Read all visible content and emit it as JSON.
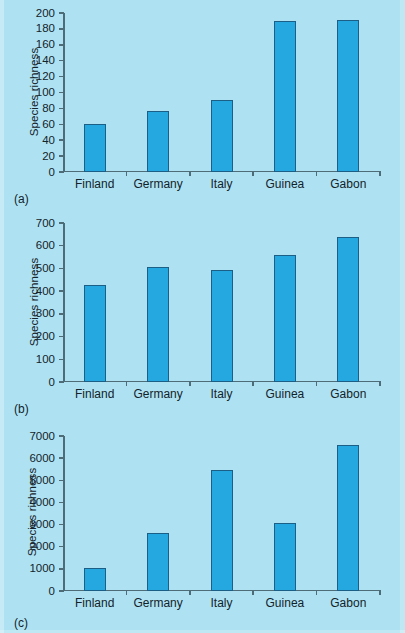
{
  "figure": {
    "background_color": "#aee2f3",
    "bar_fill_color": "#25a8e0",
    "bar_edge_color": "#1c5f86",
    "axis_color": "#4e6b78",
    "text_color": "#142229"
  },
  "panels": [
    {
      "tag": "(a)",
      "ylabel": "Species richness"
    },
    {
      "tag": "(b)",
      "ylabel": "Species richness"
    },
    {
      "tag": "(c)",
      "ylabel": "Species richness"
    }
  ],
  "chart_data": [
    {
      "type": "bar",
      "title": "",
      "panel": "(a)",
      "xlabel": "",
      "ylabel": "Species richness",
      "categories": [
        "Finland",
        "Germany",
        "Italy",
        "Guinea",
        "Gabon"
      ],
      "values": [
        61,
        77,
        91,
        190,
        191
      ],
      "ylim": [
        0,
        200
      ],
      "yticks": [
        0,
        20,
        40,
        60,
        80,
        100,
        120,
        140,
        160,
        180,
        200
      ],
      "ytick_labels": [
        "0",
        "20",
        "40",
        "60",
        "80",
        "100",
        "120",
        "140",
        "160",
        "180",
        "200"
      ],
      "grid": false,
      "legend": false
    },
    {
      "type": "bar",
      "title": "",
      "panel": "(b)",
      "xlabel": "",
      "ylabel": "Species richness",
      "categories": [
        "Finland",
        "Germany",
        "Italy",
        "Guinea",
        "Gabon"
      ],
      "values": [
        425,
        505,
        495,
        557,
        640
      ],
      "ylim": [
        0,
        700
      ],
      "yticks": [
        0,
        100,
        200,
        300,
        400,
        500,
        600,
        700
      ],
      "ytick_labels": [
        "0",
        "100",
        "200",
        "300",
        "400",
        "500",
        "600",
        "700"
      ],
      "grid": false,
      "legend": false
    },
    {
      "type": "bar",
      "title": "",
      "panel": "(c)",
      "xlabel": "",
      "ylabel": "Species richness",
      "categories": [
        "Finland",
        "Germany",
        "Italy",
        "Guinea",
        "Gabon"
      ],
      "values": [
        1050,
        2620,
        5480,
        3060,
        6600
      ],
      "ylim": [
        0,
        7000
      ],
      "yticks": [
        0,
        1000,
        2000,
        3000,
        4000,
        5000,
        6000,
        7000
      ],
      "ytick_labels": [
        "0",
        "1000",
        "2000",
        "3000",
        "4000",
        "5000",
        "6000",
        "7000"
      ],
      "grid": false,
      "legend": false
    }
  ]
}
